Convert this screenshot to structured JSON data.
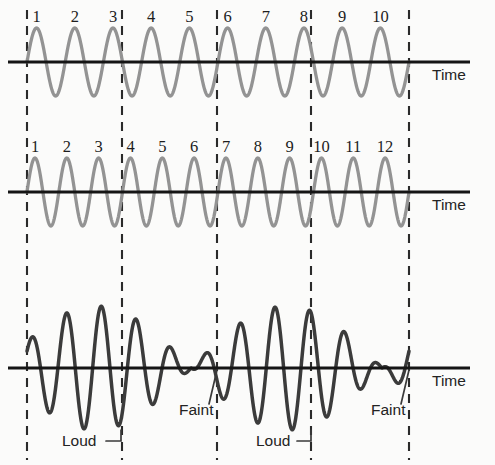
{
  "figure": {
    "width": 495,
    "height": 465,
    "background_color": "#fbfbfa"
  },
  "colors": {
    "wave_light": "#939393",
    "wave_dark": "#3b3b3b",
    "axis": "#151515",
    "dashed_guide": "#2a2a2a",
    "text": "#1d1d1d"
  },
  "guides": {
    "name": "vertical-dashed-guides",
    "x_positions": [
      27,
      122,
      217,
      311,
      409
    ],
    "y_top": 10,
    "y_bottom": 460
  },
  "panels": [
    {
      "id": "wave-top",
      "name": "upper-wave-panel",
      "axis_y": 62,
      "axis_x_start": 8,
      "axis_x_end": 470,
      "time_label": "Time",
      "time_label_x": 432,
      "time_label_y": 80,
      "wave": {
        "style": "light",
        "cycles": 10,
        "amplitude": 34,
        "x_start": 27,
        "x_end": 409,
        "phase_deg": 0
      },
      "cycle_numbers": [
        "1",
        "2",
        "3",
        "4",
        "5",
        "6",
        "7",
        "8",
        "9",
        "10"
      ],
      "cycle_number_y": 22
    },
    {
      "id": "wave-middle",
      "name": "middle-wave-panel",
      "axis_y": 192,
      "axis_x_start": 8,
      "axis_x_end": 470,
      "time_label": "Time",
      "time_label_x": 432,
      "time_label_y": 210,
      "wave": {
        "style": "light",
        "cycles": 12,
        "amplitude": 34,
        "x_start": 27,
        "x_end": 409,
        "phase_deg": 0
      },
      "cycle_numbers": [
        "1",
        "2",
        "3",
        "4",
        "5",
        "6",
        "7",
        "8",
        "9",
        "10",
        "11",
        "12"
      ],
      "cycle_number_y": 152
    },
    {
      "id": "wave-bottom",
      "name": "resultant-beat-wave-panel",
      "axis_y": 368,
      "axis_x_start": 8,
      "axis_x_end": 470,
      "time_label": "Time",
      "time_label_x": 432,
      "time_label_y": 386,
      "wave": {
        "style": "dark",
        "carrier_cycles": 11,
        "beat_cycles": 2,
        "amplitude": 62,
        "x_start": 27,
        "x_end": 409
      }
    }
  ],
  "annotations": [
    {
      "name": "loud-label-left",
      "text": "Loud",
      "text_x": 62,
      "text_y": 446,
      "leader": {
        "x1": 106,
        "y1": 441,
        "x2": 121,
        "y2": 441,
        "x3": 121,
        "y3": 430
      }
    },
    {
      "name": "faint-label-left",
      "text": "Faint",
      "text_x": 179,
      "text_y": 415,
      "leader": {
        "x1": 209,
        "y1": 404,
        "x2": 217,
        "y2": 370
      }
    },
    {
      "name": "loud-label-right",
      "text": "Loud",
      "text_x": 256,
      "text_y": 446,
      "leader": {
        "x1": 297,
        "y1": 441,
        "x2": 311,
        "y2": 441,
        "x3": 311,
        "y3": 430
      }
    },
    {
      "name": "faint-label-right",
      "text": "Faint",
      "text_x": 371,
      "text_y": 415,
      "leader": {
        "x1": 401,
        "y1": 404,
        "x2": 409,
        "y2": 370
      }
    }
  ]
}
